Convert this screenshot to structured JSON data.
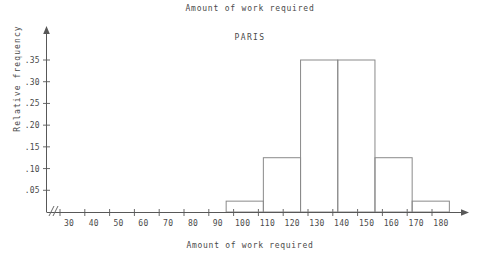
{
  "chart_data": {
    "type": "bar",
    "title": "Amount of work required",
    "subtitle": "PARIS",
    "xlabel": "Amount of work required",
    "ylabel": "Relative frequency",
    "grid": false,
    "legend": null,
    "axis_break": "//",
    "xlim": [
      25,
      188
    ],
    "ylim": [
      0,
      0.375
    ],
    "x_tick_labels": [
      "30",
      "40",
      "50",
      "60",
      "70",
      "80",
      "90",
      "100",
      "110",
      "120",
      "130",
      "140",
      "150",
      "160",
      "170",
      "180"
    ],
    "x_tick_values": [
      30,
      40,
      50,
      60,
      70,
      80,
      90,
      100,
      110,
      120,
      130,
      140,
      150,
      160,
      170,
      180
    ],
    "y_tick_labels": [
      ".05",
      ".10",
      ".15",
      ".20",
      ".25",
      ".30",
      ".35"
    ],
    "y_tick_values": [
      0.05,
      0.1,
      0.15,
      0.2,
      0.25,
      0.3,
      0.35
    ],
    "bins": [
      {
        "start": 97,
        "end": 112,
        "value": 0.025
      },
      {
        "start": 112,
        "end": 127,
        "value": 0.125
      },
      {
        "start": 127,
        "end": 142,
        "value": 0.35
      },
      {
        "start": 142,
        "end": 157,
        "value": 0.35
      },
      {
        "start": 157,
        "end": 172,
        "value": 0.125
      },
      {
        "start": 172,
        "end": 187,
        "value": 0.025
      }
    ],
    "categories": [
      "97-112",
      "112-127",
      "127-142",
      "142-157",
      "157-172",
      "172-187"
    ],
    "values": [
      0.025,
      0.125,
      0.35,
      0.35,
      0.125,
      0.025
    ],
    "colors": {
      "line": "#8a8a8a",
      "axis": "#585858",
      "text": "#4a4a4a",
      "background": "#ffffff"
    }
  }
}
